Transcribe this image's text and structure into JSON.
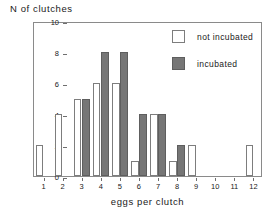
{
  "chart_data": {
    "type": "bar",
    "title": "",
    "ylabel": "N of clutches",
    "xlabel": "eggs per clutch",
    "categories": [
      "1",
      "2",
      "3",
      "4",
      "5",
      "6",
      "7",
      "8",
      "9",
      "10",
      "11",
      "12"
    ],
    "ylim": [
      0,
      10
    ],
    "yticks": [
      "0",
      "2",
      "4",
      "6",
      "8",
      "10"
    ],
    "grid": false,
    "legend_position": "top-right",
    "series": [
      {
        "name": "not incubated",
        "style": "open",
        "color": "#ffffff",
        "edge_color": "#7d7d7d",
        "values": [
          2,
          4,
          5,
          6,
          6,
          1,
          4,
          1,
          2,
          0,
          0,
          2
        ]
      },
      {
        "name": "incubated",
        "style": "filled",
        "color": "#767676",
        "edge_color": "#5e5e5e",
        "values": [
          0,
          0,
          5,
          8,
          8,
          4,
          4,
          2,
          0,
          0,
          0,
          0
        ]
      }
    ]
  },
  "legend": {
    "items": [
      {
        "label": "not incubated",
        "swatch": "open-square-swatch"
      },
      {
        "label": "incubated",
        "swatch": "filled-square-swatch"
      }
    ]
  }
}
